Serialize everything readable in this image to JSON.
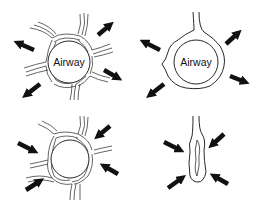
{
  "panels": [
    {
      "id": "top-left",
      "label": "Airway",
      "description": "airway tethered by surrounding parenchyma, outward traction arrows"
    },
    {
      "id": "top-right",
      "label": "Airway",
      "description": "airway with reduced tethering, outward arrows"
    },
    {
      "id": "bottom-left",
      "label": "",
      "description": "airway with parenchyma, inward compression arrows"
    },
    {
      "id": "bottom-right",
      "label": "",
      "description": "collapsed narrowed airway, inward compression arrows"
    }
  ],
  "colors": {
    "ink": "#111111",
    "background": "#ffffff"
  }
}
